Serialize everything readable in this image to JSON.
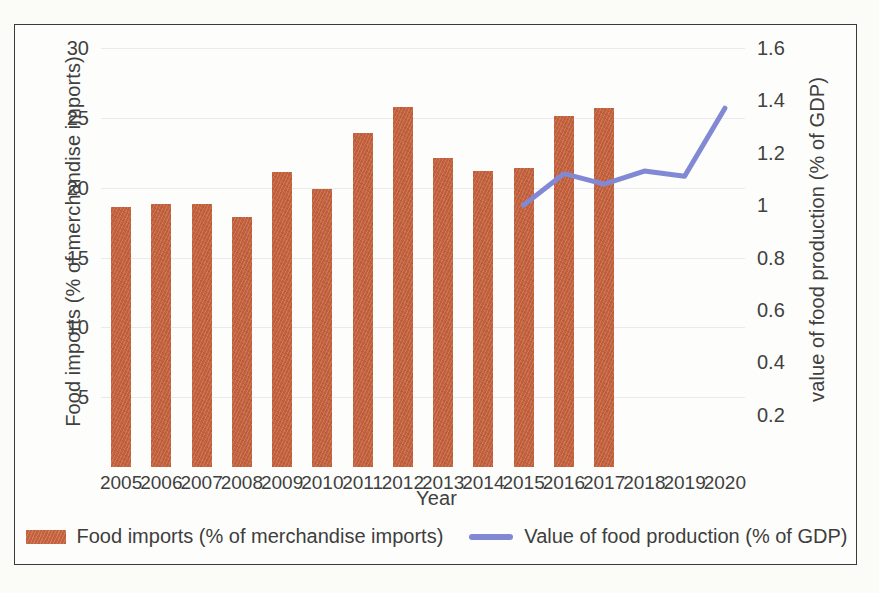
{
  "chart_data": {
    "type": "bar",
    "title": "",
    "xlabel": "Year",
    "ylabel": "Food imports (% of merchandise imports)",
    "y2label": "value of food production (% of GDP)",
    "categories": [
      "2005",
      "2006",
      "2007",
      "2008",
      "2009",
      "2010",
      "2011",
      "2012",
      "2013",
      "2014",
      "2015",
      "2016",
      "2017",
      "2018",
      "2019",
      "2020"
    ],
    "ylim": [
      0,
      30
    ],
    "y2lim": [
      0,
      1.6
    ],
    "yticks": [
      "5",
      "10",
      "15",
      "20",
      "25",
      "30"
    ],
    "ytick_values": [
      5,
      10,
      15,
      20,
      25,
      30
    ],
    "y2ticks": [
      "0.2",
      "0.4",
      "0.6",
      "0.8",
      "1",
      "1.2",
      "1.4",
      "1.6"
    ],
    "y2tick_values": [
      0.2,
      0.4,
      0.6,
      0.8,
      1.0,
      1.2,
      1.4,
      1.6
    ],
    "grid": true,
    "legend_position": "bottom",
    "series": [
      {
        "name": "Food imports (% of merchandise imports)",
        "type": "bar",
        "axis": "left",
        "color": "#c4613c",
        "values": [
          18.6,
          18.8,
          18.8,
          17.9,
          21.1,
          19.9,
          23.9,
          25.8,
          22.1,
          21.2,
          21.4,
          25.1,
          25.7,
          null,
          null,
          null
        ]
      },
      {
        "name": "Value of food production (% of GDP)",
        "type": "line",
        "axis": "right",
        "color": "#8189d4",
        "values": [
          null,
          null,
          null,
          null,
          null,
          null,
          null,
          null,
          null,
          null,
          1.0,
          1.12,
          1.08,
          1.13,
          1.11,
          1.37
        ]
      }
    ]
  },
  "legend": {
    "items": [
      {
        "label": "Food imports (% of merchandise imports)",
        "marker": "bar-swatch",
        "color": "#c4613c"
      },
      {
        "label": "Value of food production (% of GDP)",
        "marker": "line-swatch",
        "color": "#8189d4"
      }
    ]
  }
}
